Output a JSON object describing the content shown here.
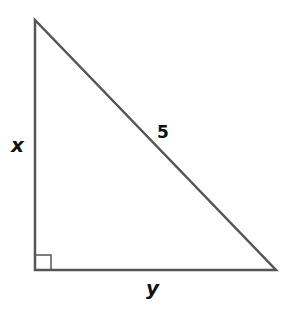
{
  "diagram": {
    "type": "right-triangle",
    "stroke_color": "#555555",
    "vertices": {
      "top": [
        35,
        20
      ],
      "right_angle": [
        35,
        270
      ],
      "bottom_right": [
        276,
        270
      ]
    },
    "labels": {
      "vertical_leg": "x",
      "hypotenuse": "5",
      "horizontal_leg": "y"
    },
    "right_angle_marker": true
  }
}
